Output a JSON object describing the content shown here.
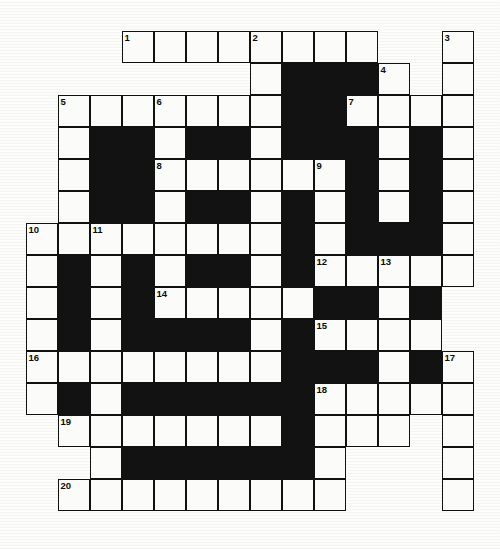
{
  "puzzle": {
    "kind": "crossword-grid",
    "title": "",
    "columns": 14,
    "rows": 15,
    "cell_size": 32,
    "origin": {
      "x": 26,
      "y": 31
    },
    "colors": {
      "page_background": "#ffffff",
      "grid_background": "#fdfdfb",
      "open_cell": "#fbfbf9",
      "blocked_cell": "#121212",
      "grid_line": "#111111",
      "number_text": "#0c0c0c"
    },
    "legend": {
      "open_cell": "white square, writable letter box",
      "blocked_cell": "solid black square",
      "numbered_cell": "white square carrying a small clue number in its top-left corner"
    },
    "clue_numbers_present": [
      1,
      2,
      3,
      4,
      5,
      6,
      7,
      8,
      9,
      10,
      11,
      12,
      13,
      14,
      15,
      16,
      17,
      18,
      19,
      20
    ],
    "numbered_cells": [
      {
        "number": "1",
        "row": 0,
        "col": 3
      },
      {
        "number": "2",
        "row": 0,
        "col": 7
      },
      {
        "number": "3",
        "row": 0,
        "col": 13
      },
      {
        "number": "4",
        "row": 1,
        "col": 11
      },
      {
        "number": "5",
        "row": 2,
        "col": 1
      },
      {
        "number": "6",
        "row": 2,
        "col": 4
      },
      {
        "number": "7",
        "row": 2,
        "col": 10
      },
      {
        "number": "8",
        "row": 4,
        "col": 4
      },
      {
        "number": "9",
        "row": 4,
        "col": 9
      },
      {
        "number": "10",
        "row": 6,
        "col": 0
      },
      {
        "number": "11",
        "row": 6,
        "col": 2
      },
      {
        "number": "12",
        "row": 7,
        "col": 9
      },
      {
        "number": "13",
        "row": 7,
        "col": 11
      },
      {
        "number": "14",
        "row": 8,
        "col": 4
      },
      {
        "number": "15",
        "row": 9,
        "col": 9
      },
      {
        "number": "16",
        "row": 10,
        "col": 0
      },
      {
        "number": "17",
        "row": 10,
        "col": 13
      },
      {
        "number": "18",
        "row": 11,
        "col": 9
      },
      {
        "number": "19",
        "row": 12,
        "col": 1
      },
      {
        "number": "20",
        "row": 14,
        "col": 1
      }
    ],
    "grid": [
      [
        null,
        null,
        null,
        "open",
        "open",
        "open",
        "open",
        "open",
        "open",
        "open",
        "open",
        null,
        null,
        "open"
      ],
      [
        null,
        null,
        null,
        null,
        null,
        null,
        null,
        "open",
        "block",
        "block",
        "block",
        "open",
        null,
        "open"
      ],
      [
        null,
        "open",
        "open",
        "open",
        "open",
        "open",
        "open",
        "open",
        "block",
        "block",
        "open",
        "open",
        "open",
        "open"
      ],
      [
        null,
        "open",
        "block",
        "block",
        "open",
        "block",
        "block",
        "open",
        "block",
        "block",
        "block",
        "open",
        "block",
        "open"
      ],
      [
        null,
        "open",
        "block",
        "block",
        "open",
        "open",
        "open",
        "open",
        "open",
        "open",
        "block",
        "open",
        "block",
        "open"
      ],
      [
        null,
        "open",
        "block",
        "block",
        "open",
        "block",
        "block",
        "open",
        "block",
        "open",
        "block",
        "open",
        "block",
        "open"
      ],
      [
        "open",
        "open",
        "open",
        "open",
        "open",
        "open",
        "open",
        "open",
        "block",
        "open",
        "block",
        "block",
        "block",
        "open"
      ],
      [
        "open",
        "block",
        "open",
        "block",
        "open",
        "block",
        "block",
        "open",
        "block",
        "open",
        "open",
        "open",
        "open",
        "open"
      ],
      [
        "open",
        "block",
        "open",
        "block",
        "open",
        "open",
        "open",
        "open",
        "open",
        "block",
        "block",
        "open",
        "block",
        null
      ],
      [
        "open",
        "block",
        "open",
        "block",
        "block",
        "block",
        "block",
        "open",
        "block",
        "open",
        "open",
        "open",
        "open",
        null
      ],
      [
        "open",
        "open",
        "open",
        "open",
        "open",
        "open",
        "open",
        "open",
        "block",
        "block",
        "block",
        "open",
        "block",
        "open"
      ],
      [
        "open",
        "block",
        "open",
        "block",
        "block",
        "block",
        "block",
        "block",
        "block",
        "open",
        "open",
        "open",
        "open",
        "open"
      ],
      [
        null,
        "open",
        "open",
        "open",
        "open",
        "open",
        "open",
        "open",
        "block",
        "open",
        "open",
        "open",
        null,
        "open"
      ],
      [
        null,
        null,
        "open",
        "block",
        "block",
        "block",
        "block",
        "block",
        "block",
        "open",
        null,
        null,
        null,
        "open"
      ],
      [
        null,
        "open",
        "open",
        "open",
        "open",
        "open",
        "open",
        "open",
        "open",
        "open",
        null,
        null,
        null,
        "open"
      ]
    ]
  }
}
